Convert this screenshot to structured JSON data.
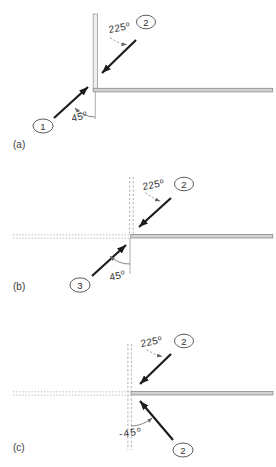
{
  "figure": {
    "deg_mark": "o",
    "colors": {
      "ink": "#1c1c1c",
      "wall_fill": "#d2d2d2",
      "background": "#ffffff"
    },
    "panels": [
      {
        "letter": "(a)",
        "upper_angle": "225",
        "lower_angle": "45",
        "upper_badge": "2",
        "lower_badge": "1"
      },
      {
        "letter": "(b)",
        "upper_angle": "225",
        "lower_angle": "45",
        "upper_badge": "2",
        "lower_badge": "3"
      },
      {
        "letter": "(c)",
        "upper_angle": "225",
        "lower_angle": "-45",
        "upper_badge": "2",
        "lower_badge": "2"
      }
    ]
  }
}
